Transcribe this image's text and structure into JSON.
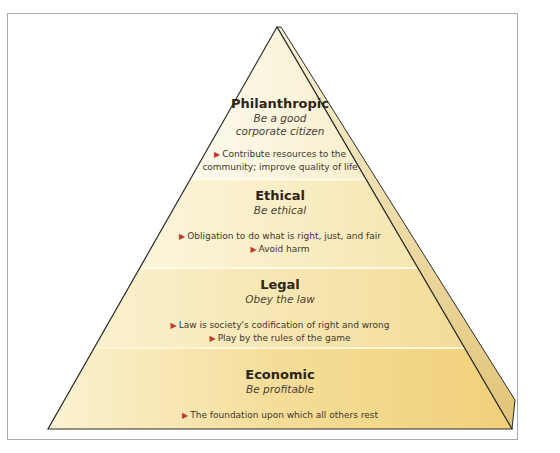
{
  "diagram": {
    "type": "pyramid",
    "colors": {
      "top_tier": "#fbf6e0",
      "base_tier": "#f2d27c",
      "outline": "#2b2b2b",
      "bullet_arrow": "#c0392b",
      "frame_border": "#a9a9a9"
    },
    "tiers": [
      {
        "title": "Philanthropic",
        "subtitle_line1": "Be a good",
        "subtitle_line2": "corporate citizen",
        "bullet_icon": "triangle-right-icon",
        "bullets": [
          "Contribute resources to the",
          "community; improve quality of life"
        ]
      },
      {
        "title": "Ethical",
        "subtitle_line1": "Be ethical",
        "bullet_icon": "triangle-right-icon",
        "bullets": [
          "Obligation to do what is right, just, and fair",
          "Avoid harm"
        ]
      },
      {
        "title": "Legal",
        "subtitle_line1": "Obey the law",
        "bullet_icon": "triangle-right-icon",
        "bullets": [
          "Law is society's codification of right and wrong",
          "Play by the rules of the game"
        ]
      },
      {
        "title": "Economic",
        "subtitle_line1": "Be profitable",
        "bullet_icon": "triangle-right-icon",
        "bullets": [
          "The foundation upon which all others rest"
        ]
      }
    ]
  }
}
